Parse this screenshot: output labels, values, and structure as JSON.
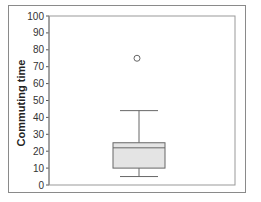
{
  "chart_data": {
    "type": "box",
    "title": "",
    "xlabel": "",
    "ylabel": "Commuting time",
    "ylim": [
      0,
      100
    ],
    "yticks": [
      0,
      10,
      20,
      30,
      40,
      50,
      60,
      70,
      80,
      90,
      100
    ],
    "grid": false,
    "legend": null,
    "series": [
      {
        "name": "Commuting time",
        "whisker_low": 5,
        "q1": 10,
        "median": 22,
        "q3": 25,
        "whisker_high": 44,
        "outliers": [
          75
        ]
      }
    ]
  },
  "colors": {
    "box_fill": "#e4e4e4",
    "lines": "#666666",
    "frame": "#8a8a8a"
  }
}
